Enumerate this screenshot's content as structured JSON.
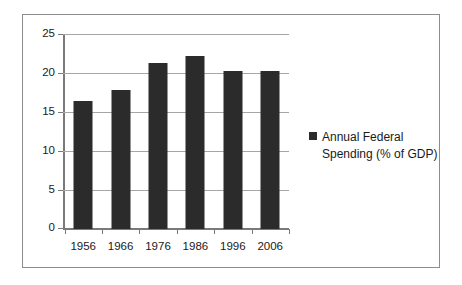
{
  "chart_data": {
    "type": "bar",
    "title": "",
    "subtitle": "",
    "xlabel": "",
    "ylabel": "",
    "categories": [
      "1956",
      "1966",
      "1976",
      "1986",
      "1996",
      "2006"
    ],
    "series": [
      {
        "name": "Annual Federal Spending (% of GDP)",
        "values": [
          16.5,
          17.9,
          21.4,
          22.3,
          20.3,
          20.3
        ],
        "color": "#2b2b2b"
      }
    ],
    "ylim": [
      0,
      25
    ],
    "y_ticks": [
      "0",
      "5",
      "10",
      "15",
      "20",
      "25"
    ],
    "y_tick_values": [
      0,
      5,
      10,
      15,
      20,
      25
    ],
    "grid": true,
    "legend_position": "right",
    "legend_entries": [
      {
        "label": "Annual Federal Spending (% of GDP)",
        "marker": "square-marker",
        "color": "#2b2b2b"
      }
    ],
    "border_color": "#8d8d8d",
    "axis_color": "#7a7a7a",
    "gridline_color": "#a6a6a6"
  }
}
